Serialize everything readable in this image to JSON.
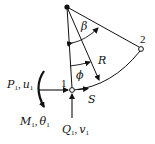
{
  "diagram": {
    "nodes": [
      {
        "id": "1",
        "label": "1"
      },
      {
        "id": "2",
        "label": "2"
      }
    ],
    "labels": {
      "beta": "β",
      "phi": "ϕ",
      "radius": "R",
      "arc_length": "S",
      "axial_load": "P",
      "axial_sub": "1",
      "axial_disp": "u",
      "axial_disp_sub": "1",
      "moment": "M",
      "moment_sub": "1",
      "rotation": "θ",
      "rotation_sub": "1",
      "shear": "Q",
      "shear_sub": "1",
      "shear_disp": "v",
      "shear_disp_sub": "1",
      "comma": ","
    },
    "colors": {
      "stroke": "#111111",
      "background": "#ffffff"
    }
  }
}
